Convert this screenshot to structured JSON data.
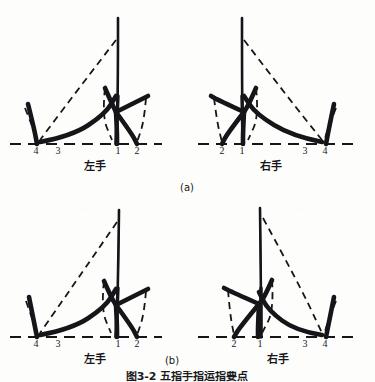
{
  "figure": {
    "background_color": "#fdfdfc",
    "ink_color": "#16161a",
    "caption": "图3-2  五指手指运指要点",
    "subfigures": [
      {
        "id": "a",
        "label": "(a)"
      },
      {
        "id": "b",
        "label": "(b)"
      }
    ]
  },
  "panels": {
    "a_left": {
      "hand_label": "左手",
      "digits": [
        "4",
        "3",
        "1",
        "2"
      ]
    },
    "a_right": {
      "hand_label": "右手",
      "digits": [
        "2",
        "1",
        "3",
        "4"
      ]
    },
    "b_left": {
      "hand_label": "左手",
      "digits": [
        "4",
        "3",
        "1",
        "2"
      ]
    },
    "b_right": {
      "hand_label": "右手",
      "digits": [
        "2",
        "1",
        "3",
        "4"
      ]
    }
  },
  "chart_data": {
    "type": "line",
    "title": "图3-2  五指手指运指要点",
    "xlabel": "",
    "ylabel": "",
    "subplots": [
      {
        "id": "a-left",
        "caption": "(a) 左手",
        "hand": "左手",
        "baseline_y": 144,
        "tick_labels": [
          "4",
          "3",
          "1",
          "2"
        ],
        "tick_x": [
          36,
          58,
          118,
          137
        ],
        "solid_strokes": [
          {
            "name": "tall-center-spike",
            "points": [
              [
                118,
                18
              ],
              [
                118,
                96
              ],
              [
                116,
                144
              ]
            ]
          },
          {
            "name": "left-outer-hook",
            "points": [
              [
                28,
                104
              ],
              [
                34,
                128
              ],
              [
                37,
                144
              ]
            ]
          },
          {
            "name": "long-sweep",
            "points": [
              [
                40,
                142
              ],
              [
                72,
                136
              ],
              [
                105,
                114
              ],
              [
                116,
                96
              ]
            ]
          },
          {
            "name": "splay-up-left",
            "points": [
              [
                105,
                88
              ],
              [
                112,
                104
              ],
              [
                116,
                112
              ]
            ]
          },
          {
            "name": "splay-right-arm",
            "points": [
              [
                116,
                112
              ],
              [
                140,
                100
              ],
              [
                148,
                96
              ]
            ]
          },
          {
            "name": "down-stroke-1",
            "points": [
              [
                116,
                112
              ],
              [
                117,
                132
              ],
              [
                117,
                144
              ]
            ]
          },
          {
            "name": "down-stroke-2",
            "points": [
              [
                116,
                112
              ],
              [
                132,
                134
              ],
              [
                137,
                144
              ]
            ]
          }
        ],
        "dashed_strokes": [
          {
            "name": "apex-to-left",
            "points": [
              [
                116,
                40
              ],
              [
                70,
                100
              ],
              [
                40,
                140
              ]
            ]
          },
          {
            "name": "left-small-arc",
            "points": [
              [
                25,
                108
              ],
              [
                33,
                128
              ],
              [
                38,
                142
              ]
            ]
          },
          {
            "name": "inner-arc",
            "points": [
              [
                105,
                88
              ],
              [
                102,
                116
              ],
              [
                112,
                140
              ]
            ]
          },
          {
            "name": "right-arc",
            "points": [
              [
                146,
                98
              ],
              [
                144,
                122
              ],
              [
                137,
                142
              ]
            ]
          }
        ],
        "baseline_dashes": [
          [
            10,
            162
          ]
        ]
      },
      {
        "id": "a-right",
        "caption": "(a) 右手",
        "hand": "右手",
        "baseline_y": 144,
        "tick_labels": [
          "2",
          "1",
          "3",
          "4"
        ],
        "tick_x": [
          222,
          242,
          305,
          325
        ],
        "solid_strokes": [
          {
            "name": "tall-center-spike",
            "points": [
              [
                242,
                18
              ],
              [
                242,
                96
              ],
              [
                243,
                144
              ]
            ]
          },
          {
            "name": "right-outer-hook",
            "points": [
              [
                334,
                104
              ],
              [
                329,
                128
              ],
              [
                326,
                144
              ]
            ]
          },
          {
            "name": "long-sweep",
            "points": [
              [
                322,
                142
              ],
              [
                292,
                136
              ],
              [
                256,
                114
              ],
              [
                244,
                96
              ]
            ]
          },
          {
            "name": "splay-up-right",
            "points": [
              [
                256,
                88
              ],
              [
                249,
                104
              ],
              [
                244,
                112
              ]
            ]
          },
          {
            "name": "splay-left-arm",
            "points": [
              [
                244,
                112
              ],
              [
                218,
                100
              ],
              [
                211,
                96
              ]
            ]
          },
          {
            "name": "down-stroke-1",
            "points": [
              [
                244,
                112
              ],
              [
                243,
                132
              ],
              [
                243,
                144
              ]
            ]
          },
          {
            "name": "down-stroke-2",
            "points": [
              [
                244,
                112
              ],
              [
                227,
                134
              ],
              [
                222,
                144
              ]
            ]
          }
        ],
        "dashed_strokes": [
          {
            "name": "apex-to-right",
            "points": [
              [
                244,
                40
              ],
              [
                290,
                100
              ],
              [
                322,
                140
              ]
            ]
          },
          {
            "name": "right-small-arc",
            "points": [
              [
                336,
                108
              ],
              [
                328,
                128
              ],
              [
                324,
                142
              ]
            ]
          },
          {
            "name": "inner-arc",
            "points": [
              [
                256,
                88
              ],
              [
                259,
                116
              ],
              [
                248,
                140
              ]
            ]
          },
          {
            "name": "left-arc",
            "points": [
              [
                214,
                98
              ],
              [
                217,
                122
              ],
              [
                222,
                142
              ]
            ]
          }
        ],
        "baseline_dashes": [
          [
            198,
            356
          ]
        ]
      },
      {
        "id": "b-left",
        "caption": "(b) 左手",
        "hand": "左手",
        "baseline_y": 337,
        "tick_labels": [
          "4",
          "3",
          "1",
          "2"
        ],
        "tick_x": [
          36,
          58,
          118,
          137
        ],
        "solid_strokes": [
          {
            "name": "tall-center-spike",
            "points": [
              [
                119,
                210
              ],
              [
                118,
                288
              ],
              [
                116,
                337
              ]
            ]
          },
          {
            "name": "left-outer-hook",
            "points": [
              [
                29,
                297
              ],
              [
                34,
                322
              ],
              [
                37,
                337
              ]
            ]
          },
          {
            "name": "long-sweep",
            "points": [
              [
                40,
                335
              ],
              [
                72,
                329
              ],
              [
                105,
                307
              ],
              [
                116,
                289
              ]
            ]
          },
          {
            "name": "splay-up-left",
            "points": [
              [
                104,
                281
              ],
              [
                111,
                297
              ],
              [
                116,
                305
              ]
            ]
          },
          {
            "name": "splay-right-arm",
            "points": [
              [
                116,
                305
              ],
              [
                140,
                293
              ],
              [
                148,
                289
              ]
            ]
          },
          {
            "name": "down-stroke-1",
            "points": [
              [
                116,
                305
              ],
              [
                117,
                325
              ],
              [
                117,
                337
              ]
            ]
          },
          {
            "name": "down-stroke-2",
            "points": [
              [
                116,
                305
              ],
              [
                132,
                327
              ],
              [
                137,
                337
              ]
            ]
          }
        ],
        "dashed_strokes": [
          {
            "name": "apex-to-left",
            "points": [
              [
                117,
                222
              ],
              [
                70,
                290
              ],
              [
                40,
                333
              ]
            ]
          },
          {
            "name": "left-small-arc",
            "points": [
              [
                26,
                301
              ],
              [
                33,
                321
              ],
              [
                38,
                335
              ]
            ]
          },
          {
            "name": "inner-arc",
            "points": [
              [
                104,
                281
              ],
              [
                101,
                309
              ],
              [
                111,
                333
              ]
            ]
          },
          {
            "name": "right-arc",
            "points": [
              [
                146,
                291
              ],
              [
                144,
                315
              ],
              [
                137,
                335
              ]
            ]
          }
        ],
        "baseline_dashes": [
          [
            10,
            162
          ]
        ]
      },
      {
        "id": "b-right",
        "caption": "(b) 右手",
        "hand": "右手",
        "baseline_y": 337,
        "tick_labels": [
          "2",
          "1",
          "3",
          "4"
        ],
        "tick_x": [
          222,
          242,
          305,
          325
        ],
        "solid_strokes": [
          {
            "name": "tall-center-spike",
            "points": [
              [
                260,
                208
              ],
              [
                261,
                288
              ],
              [
                261,
                337
              ]
            ]
          },
          {
            "name": "right-outer-hook",
            "points": [
              [
                334,
                297
              ],
              [
                329,
                322
              ],
              [
                326,
                337
              ]
            ]
          },
          {
            "name": "long-sweep",
            "points": [
              [
                322,
                335
              ],
              [
                296,
                331
              ],
              [
                268,
                310
              ],
              [
                259,
                292
              ]
            ]
          },
          {
            "name": "splay-up-right",
            "points": [
              [
                272,
                280
              ],
              [
                265,
                296
              ],
              [
                259,
                304
              ]
            ]
          },
          {
            "name": "splay-left-arm",
            "points": [
              [
                259,
                304
              ],
              [
                232,
                292
              ],
              [
                224,
                288
              ]
            ]
          },
          {
            "name": "down-stroke-1",
            "points": [
              [
                259,
                304
              ],
              [
                258,
                325
              ],
              [
                258,
                337
              ]
            ]
          },
          {
            "name": "down-stroke-2",
            "points": [
              [
                259,
                304
              ],
              [
                240,
                327
              ],
              [
                234,
                337
              ]
            ]
          }
        ],
        "dashed_strokes": [
          {
            "name": "apex-to-right",
            "points": [
              [
                263,
                218
              ],
              [
                300,
                286
              ],
              [
                322,
                333
              ]
            ]
          },
          {
            "name": "right-small-arc",
            "points": [
              [
                336,
                301
              ],
              [
                328,
                321
              ],
              [
                324,
                335
              ]
            ]
          },
          {
            "name": "inner-arc",
            "points": [
              [
                272,
                280
              ],
              [
                274,
                310
              ],
              [
                262,
                333
              ]
            ]
          },
          {
            "name": "left-arc",
            "points": [
              [
                228,
                290
              ],
              [
                230,
                314
              ],
              [
                234,
                335
              ]
            ]
          }
        ],
        "baseline_dashes": [
          [
            198,
            356
          ]
        ]
      }
    ]
  }
}
